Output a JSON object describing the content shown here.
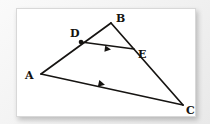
{
  "figure": {
    "background_color": "#f2f2f2",
    "card_color": "#ffffff",
    "ink_color": "#161412",
    "points": [
      {
        "name": "A",
        "label": "A",
        "x": 24,
        "y": 65,
        "label_x": 10,
        "label_y": 70
      },
      {
        "name": "B",
        "label": "B",
        "x": 94,
        "y": 14,
        "label_x": 100,
        "label_y": 13
      },
      {
        "name": "C",
        "label": "C",
        "x": 166,
        "y": 96,
        "label_x": 170,
        "label_y": 104
      },
      {
        "name": "D",
        "label": "D",
        "x": 64,
        "y": 33,
        "label_x": 55,
        "label_y": 28
      },
      {
        "name": "E",
        "label": "E",
        "x": 117,
        "y": 40,
        "label_x": 122,
        "label_y": 48
      }
    ],
    "segments": [
      {
        "name": "segment-AB",
        "from": "A",
        "to": "B",
        "arrow_marks": 0,
        "width": 1.6
      },
      {
        "name": "segment-BC",
        "from": "B",
        "to": "C",
        "arrow_marks": 0,
        "width": 1.6
      },
      {
        "name": "segment-AC",
        "from": "A",
        "to": "C",
        "arrow_marks": 1,
        "width": 1.6
      },
      {
        "name": "segment-DE",
        "from": "D",
        "to": "E",
        "arrow_marks": 1,
        "width": 1.6
      }
    ],
    "marked_points": [
      "D"
    ],
    "parallel_pairs": [
      [
        "segment-DE",
        "segment-AC"
      ]
    ],
    "labels": [
      "A",
      "B",
      "C",
      "D",
      "E"
    ]
  }
}
